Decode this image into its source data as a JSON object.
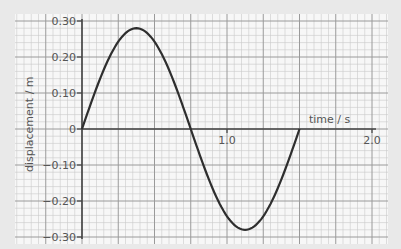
{
  "chart_data": {
    "type": "line",
    "title": "",
    "xlabel": "time / s",
    "ylabel": "displacement / m",
    "xlim": [
      0,
      2.0
    ],
    "ylim": [
      -0.3,
      0.3
    ],
    "x_ticks": [
      {
        "value": 1.0,
        "label": "1.0"
      },
      {
        "value": 2.0,
        "label": "2.0"
      }
    ],
    "y_ticks": [
      {
        "value": 0.3,
        "label": "0.30"
      },
      {
        "value": 0.2,
        "label": "0.20"
      },
      {
        "value": 0.1,
        "label": "0.10"
      },
      {
        "value": 0,
        "label": "0"
      },
      {
        "value": -0.1,
        "label": "-0.10"
      },
      {
        "value": -0.2,
        "label": "-0.20"
      },
      {
        "value": -0.3,
        "label": "-0.30"
      }
    ],
    "grid": true,
    "legend": null,
    "series": [
      {
        "name": "displacement",
        "shape": "sine",
        "amplitude": 0.28,
        "period": 1.5,
        "t_start": 0,
        "t_end": 1.5,
        "x": [
          0,
          0.1875,
          0.375,
          0.5625,
          0.75,
          0.9375,
          1.125,
          1.3125,
          1.5
        ],
        "values": [
          0,
          0.198,
          0.28,
          0.198,
          0,
          -0.198,
          -0.28,
          -0.198,
          0
        ]
      }
    ]
  },
  "colors": {
    "background": "#e9e9e9",
    "paper": "#f7f7f7",
    "minor_grid": "#c9c9c9",
    "major_grid": "#9a9a9a",
    "axis": "#444444",
    "curve": "#2e2e2e",
    "text": "#555555"
  }
}
